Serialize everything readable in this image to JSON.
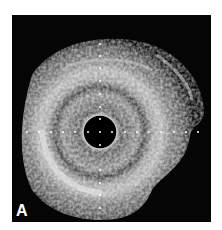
{
  "figure": {
    "panel_label": "A",
    "colors": {
      "background": "#ffffff",
      "frame": "#050505",
      "tissue_light": "#d8d8d8",
      "tissue_mid": "#7a7a7a",
      "lumen": "#000000",
      "marker_dots": "#ffffff"
    },
    "calibration_marks": {
      "horizontal_count": 15,
      "vertical_count": 13
    }
  }
}
